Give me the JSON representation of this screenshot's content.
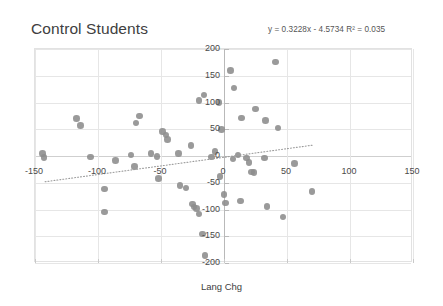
{
  "chart_data": {
    "type": "scatter",
    "title": "Control Students",
    "xlabel": "Lang Chg",
    "ylabel": "Math Chg",
    "xlim": [
      -150,
      150
    ],
    "ylim": [
      -200,
      200
    ],
    "xticks": [
      -150,
      -100,
      -50,
      0,
      50,
      100,
      150
    ],
    "yticks": [
      200,
      150,
      100,
      50,
      0,
      -50,
      -100,
      -150,
      -200
    ],
    "grid": true,
    "legend": "none",
    "annotation": "y = 0.3228x - 4.5734  R² = 0.035",
    "trendline": {
      "equation": "y = 0.3228x - 4.5734",
      "r_squared": 0.035,
      "slope": 0.3228,
      "intercept": -4.5734,
      "style": "dotted",
      "color": "#9a9a9a",
      "x_start": -142,
      "x_end": 72
    },
    "marker_color": "#8c8c8c",
    "points": [
      {
        "x": -143,
        "y": -3
      },
      {
        "x": -144,
        "y": 5
      },
      {
        "x": -117,
        "y": 70
      },
      {
        "x": -114,
        "y": 57
      },
      {
        "x": -106,
        "y": -2
      },
      {
        "x": -95,
        "y": -62
      },
      {
        "x": -95,
        "y": -105
      },
      {
        "x": -86,
        "y": -8
      },
      {
        "x": -74,
        "y": 2
      },
      {
        "x": -71,
        "y": -20
      },
      {
        "x": -70,
        "y": 62
      },
      {
        "x": -67,
        "y": 75
      },
      {
        "x": -58,
        "y": 5
      },
      {
        "x": -53,
        "y": -1
      },
      {
        "x": -52,
        "y": -42
      },
      {
        "x": -49,
        "y": 46
      },
      {
        "x": -46,
        "y": 39
      },
      {
        "x": -45,
        "y": 31
      },
      {
        "x": -36,
        "y": 5
      },
      {
        "x": -35,
        "y": -55
      },
      {
        "x": -30,
        "y": -60
      },
      {
        "x": -26,
        "y": 20
      },
      {
        "x": -25,
        "y": -90
      },
      {
        "x": -24,
        "y": -95
      },
      {
        "x": -22,
        "y": -98
      },
      {
        "x": -20,
        "y": -108
      },
      {
        "x": -20,
        "y": 104
      },
      {
        "x": -17,
        "y": -146
      },
      {
        "x": -16,
        "y": 114
      },
      {
        "x": -15,
        "y": -186
      },
      {
        "x": -10,
        "y": -2
      },
      {
        "x": -7,
        "y": 8
      },
      {
        "x": -4,
        "y": 100
      },
      {
        "x": -3,
        "y": -38
      },
      {
        "x": -2,
        "y": 50
      },
      {
        "x": 0,
        "y": -72
      },
      {
        "x": 1,
        "y": -88
      },
      {
        "x": 5,
        "y": 160
      },
      {
        "x": 7,
        "y": -6
      },
      {
        "x": 8,
        "y": 127
      },
      {
        "x": 11,
        "y": 2
      },
      {
        "x": 13,
        "y": -84
      },
      {
        "x": 14,
        "y": 71
      },
      {
        "x": 18,
        "y": -4
      },
      {
        "x": 20,
        "y": -12
      },
      {
        "x": 22,
        "y": -30
      },
      {
        "x": 24,
        "y": -31
      },
      {
        "x": 25,
        "y": 88
      },
      {
        "x": 32,
        "y": -4
      },
      {
        "x": 33,
        "y": 66
      },
      {
        "x": 34,
        "y": -94
      },
      {
        "x": 41,
        "y": 176
      },
      {
        "x": 43,
        "y": 52
      },
      {
        "x": 47,
        "y": -114
      },
      {
        "x": 56,
        "y": -14
      },
      {
        "x": 70,
        "y": -66
      }
    ]
  }
}
